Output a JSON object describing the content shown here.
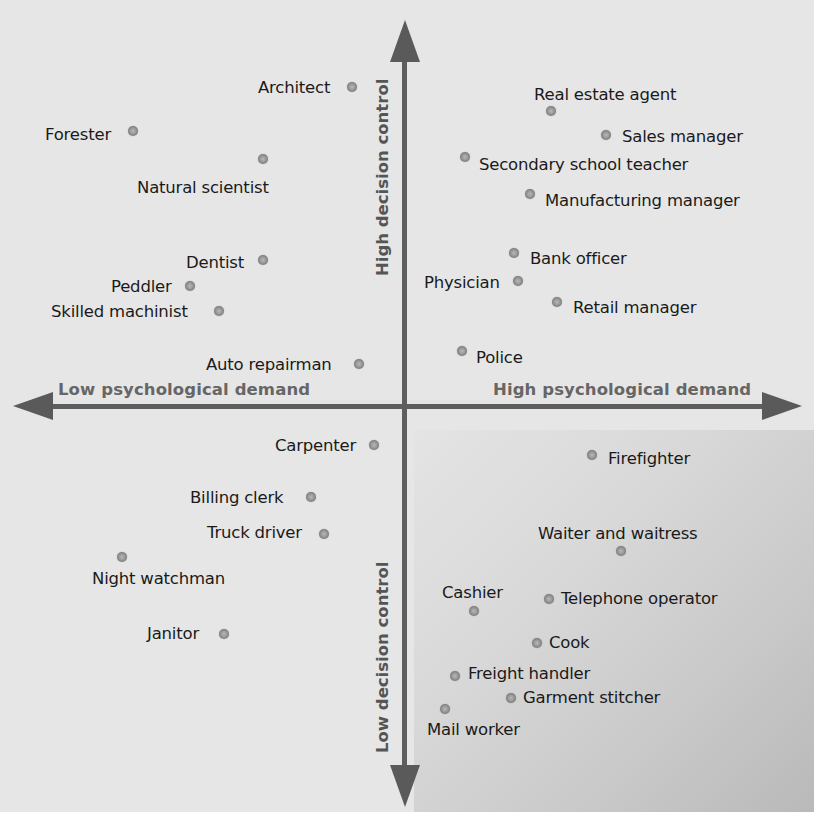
{
  "axes": {
    "x_low": "Low psychological demand",
    "x_high": "High psychological demand",
    "y_high": "High decision control",
    "y_low": "Low decision control"
  },
  "colors": {
    "background": "#e6e6e6",
    "axis": "#5e5e5e",
    "axis_label": "#666666",
    "dot": "#8f8f8f",
    "shaded_quadrant": "#c4c4c4"
  },
  "chart_data": {
    "type": "scatter",
    "title": "",
    "xlabel": "Psychological demand (Low → High)",
    "ylabel": "Decision control (Low → High)",
    "xlim": [
      -1,
      1
    ],
    "ylim": [
      -1,
      1
    ],
    "grid": false,
    "legend": "none",
    "quadrant_axes_labels": {
      "left": "Low psychological demand",
      "right": "High psychological demand",
      "top": "High decision control",
      "bottom": "Low decision control"
    },
    "points": [
      {
        "label": "Architect",
        "px": 352,
        "py": 87,
        "lx": 258,
        "ly": 78,
        "x": -0.13,
        "y": 0.81
      },
      {
        "label": "Forester",
        "px": 133,
        "py": 131,
        "lx": 45,
        "ly": 125,
        "x": -0.7,
        "y": 0.7
      },
      {
        "label": "Natural scientist",
        "px": 263,
        "py": 159,
        "lx": 137,
        "ly": 178,
        "x": -0.37,
        "y": 0.63
      },
      {
        "label": "Dentist",
        "px": 263,
        "py": 260,
        "lx": 186,
        "ly": 253,
        "x": -0.37,
        "y": 0.38
      },
      {
        "label": "Peddler",
        "px": 190,
        "py": 286,
        "lx": 111,
        "ly": 277,
        "x": -0.56,
        "y": 0.31
      },
      {
        "label": "Skilled machinist",
        "px": 219,
        "py": 311,
        "lx": 51,
        "ly": 302,
        "x": -0.48,
        "y": 0.25
      },
      {
        "label": "Auto repairman",
        "px": 359,
        "py": 364,
        "lx": 206,
        "ly": 355,
        "x": -0.12,
        "y": 0.11
      },
      {
        "label": "Real estate agent",
        "px": 551,
        "py": 111,
        "lx": 534,
        "ly": 85,
        "x": 0.38,
        "y": 0.74
      },
      {
        "label": "Sales manager",
        "px": 606,
        "py": 135,
        "lx": 622,
        "ly": 127,
        "x": 0.52,
        "y": 0.68
      },
      {
        "label": "Secondary school teacher",
        "px": 465,
        "py": 157,
        "lx": 479,
        "ly": 155,
        "x": 0.16,
        "y": 0.62
      },
      {
        "label": "Manufacturing manager",
        "px": 530,
        "py": 194,
        "lx": 545,
        "ly": 191,
        "x": 0.33,
        "y": 0.53
      },
      {
        "label": "Bank officer",
        "px": 514,
        "py": 253,
        "lx": 530,
        "ly": 249,
        "x": 0.29,
        "y": 0.38
      },
      {
        "label": "Physician",
        "px": 518,
        "py": 281,
        "lx": 424,
        "ly": 273,
        "x": 0.3,
        "y": 0.31
      },
      {
        "label": "Retail manager",
        "px": 557,
        "py": 302,
        "lx": 573,
        "ly": 298,
        "x": 0.4,
        "y": 0.26
      },
      {
        "label": "Police",
        "px": 462,
        "py": 351,
        "lx": 476,
        "ly": 348,
        "x": 0.15,
        "y": 0.14
      },
      {
        "label": "Carpenter",
        "px": 374,
        "py": 445,
        "lx": 275,
        "ly": 436,
        "x": -0.08,
        "y": -0.1
      },
      {
        "label": "Billing clerk",
        "px": 311,
        "py": 497,
        "lx": 190,
        "ly": 488,
        "x": -0.23,
        "y": -0.23
      },
      {
        "label": "Truck driver",
        "px": 324,
        "py": 534,
        "lx": 207,
        "ly": 523,
        "x": -0.2,
        "y": -0.32
      },
      {
        "label": "Night watchman",
        "px": 122,
        "py": 557,
        "lx": 92,
        "ly": 569,
        "x": -0.73,
        "y": -0.38
      },
      {
        "label": "Janitor",
        "px": 224,
        "py": 634,
        "lx": 147,
        "ly": 624,
        "x": -0.47,
        "y": -0.57
      },
      {
        "label": "Firefighter",
        "px": 592,
        "py": 455,
        "lx": 608,
        "ly": 449,
        "x": 0.48,
        "y": -0.12
      },
      {
        "label": "Waiter and waitress",
        "px": 621,
        "py": 551,
        "lx": 538,
        "ly": 524,
        "x": 0.55,
        "y": -0.36
      },
      {
        "label": "Cashier",
        "px": 474,
        "py": 611,
        "lx": 442,
        "ly": 583,
        "x": 0.18,
        "y": -0.51
      },
      {
        "label": "Telephone operator",
        "px": 549,
        "py": 599,
        "lx": 561,
        "ly": 589,
        "x": 0.37,
        "y": -0.48
      },
      {
        "label": "Cook",
        "px": 537,
        "py": 643,
        "lx": 549,
        "ly": 633,
        "x": 0.34,
        "y": -0.59
      },
      {
        "label": "Freight handler",
        "px": 455,
        "py": 676,
        "lx": 468,
        "ly": 664,
        "x": 0.13,
        "y": -0.67
      },
      {
        "label": "Garment stitcher",
        "px": 511,
        "py": 698,
        "lx": 523,
        "ly": 688,
        "x": 0.27,
        "y": -0.72
      },
      {
        "label": "Mail worker",
        "px": 445,
        "py": 709,
        "lx": 427,
        "ly": 720,
        "x": 0.1,
        "y": -0.75
      }
    ]
  }
}
